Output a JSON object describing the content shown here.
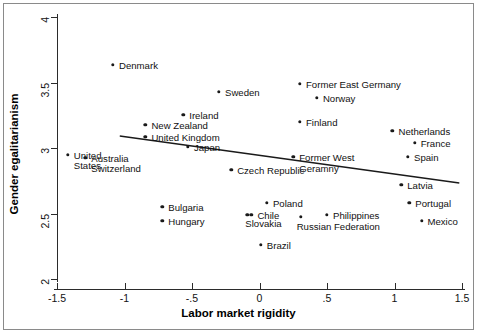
{
  "chart_data": {
    "type": "scatter",
    "title": "",
    "xlabel": "Labor market rigidity",
    "ylabel": "Gender egalitarianism",
    "xlim": [
      -1.5,
      1.5
    ],
    "ylim": [
      2,
      4
    ],
    "xticks": [
      "-1.5",
      "-1",
      "-.5",
      "0",
      ".5",
      "1",
      "1.5"
    ],
    "xtick_values": [
      -1.5,
      -1,
      -0.5,
      0,
      0.5,
      1,
      1.5
    ],
    "yticks": [
      "2",
      "2.5",
      "3",
      "3.5",
      "4"
    ],
    "ytick_values": [
      2,
      2.5,
      3,
      3.5,
      4
    ],
    "grid": false,
    "legend": null,
    "marker_color": "#1a1a1a",
    "line_color": "#1a1a1a",
    "points": [
      {
        "label": "Denmark",
        "x": -1.085,
        "y": 3.633,
        "lx": 6,
        "ly": -4
      },
      {
        "label": "Ireland",
        "x": -0.565,
        "y": 3.252,
        "lx": 6,
        "ly": -4
      },
      {
        "label": "New Zealand",
        "x": -0.845,
        "y": 3.176,
        "lx": 6,
        "ly": -4
      },
      {
        "label": "United Kingdom",
        "x": -0.845,
        "y": 3.084,
        "lx": 6,
        "ly": -4
      },
      {
        "label": "Japan",
        "x": -0.53,
        "y": 3.008,
        "lx": 6,
        "ly": -4
      },
      {
        "label": "United\nStates",
        "x": -1.42,
        "y": 2.947,
        "lx": 6,
        "ly": -4
      },
      {
        "label": "Australia\nSwitzerland",
        "x": -1.29,
        "y": 2.924,
        "lx": 6,
        "ly": -4
      },
      {
        "label": "Sweden",
        "x": -0.3,
        "y": 3.427,
        "lx": 6,
        "ly": -4
      },
      {
        "label": "Former East Germany",
        "x": 0.3,
        "y": 3.489,
        "lx": 6,
        "ly": -4
      },
      {
        "label": "Norway",
        "x": 0.425,
        "y": 3.382,
        "lx": 6,
        "ly": -4
      },
      {
        "label": "Finland",
        "x": 0.3,
        "y": 3.198,
        "lx": 6,
        "ly": -4
      },
      {
        "label": "Netherlands",
        "x": 0.985,
        "y": 3.13,
        "lx": 6,
        "ly": -4
      },
      {
        "label": "France",
        "x": 1.15,
        "y": 3.038,
        "lx": 6,
        "ly": -4
      },
      {
        "label": "Spain",
        "x": 1.1,
        "y": 2.931,
        "lx": 6,
        "ly": -4
      },
      {
        "label": "Former West\nGeramny",
        "x": 0.25,
        "y": 2.931,
        "lx": 6,
        "ly": -4
      },
      {
        "label": "Czech Republic",
        "x": -0.21,
        "y": 2.832,
        "lx": 6,
        "ly": -4
      },
      {
        "label": "Latvia",
        "x": 1.05,
        "y": 2.718,
        "lx": 6,
        "ly": -4
      },
      {
        "label": "Portugal",
        "x": 1.11,
        "y": 2.58,
        "lx": 6,
        "ly": -4
      },
      {
        "label": "Poland",
        "x": 0.055,
        "y": 2.58,
        "lx": 6,
        "ly": -4
      },
      {
        "label": "Bulgaria",
        "x": -0.72,
        "y": 2.55,
        "lx": 6,
        "ly": -4
      },
      {
        "label": "Chile",
        "x": -0.06,
        "y": 2.489,
        "lx": 6,
        "ly": -4
      },
      {
        "label": "Slovakia",
        "x": -0.09,
        "y": 2.489,
        "lx": -2,
        "ly": 4
      },
      {
        "label": "Russian Federation",
        "x": 0.305,
        "y": 2.474,
        "lx": -4,
        "ly": 5
      },
      {
        "label": "Philippines",
        "x": 0.5,
        "y": 2.489,
        "lx": 6,
        "ly": -4
      },
      {
        "label": "Hungary",
        "x": -0.72,
        "y": 2.443,
        "lx": 6,
        "ly": -4
      },
      {
        "label": "Mexico",
        "x": 1.2,
        "y": 2.443,
        "lx": 6,
        "ly": -4
      },
      {
        "label": "Brazil",
        "x": 0.01,
        "y": 2.26,
        "lx": 6,
        "ly": -4
      }
    ],
    "fit_line": {
      "x_start": -1.035,
      "y_start": 3.092,
      "x_end": 1.48,
      "y_end": 2.733
    }
  },
  "figure": {
    "xaxis_title": "Labor market rigidity",
    "yaxis_title": "Gender egalitarianism"
  }
}
